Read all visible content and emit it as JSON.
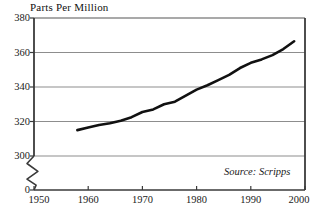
{
  "chart_data": {
    "type": "line",
    "title": "Parts Per Million",
    "xlabel": "",
    "ylabel": "",
    "source_note": "Source: Scripps",
    "grid": true,
    "legend": "none",
    "axis_break": true,
    "xlim": [
      1950,
      2000
    ],
    "ylim": [
      300,
      380
    ],
    "y_baseline_label": "0",
    "yticks": [
      380,
      360,
      340,
      320,
      300
    ],
    "ytick_labels": [
      "380",
      "360",
      "340",
      "320",
      "300",
      "0"
    ],
    "xticks": [
      1950,
      1960,
      1970,
      1980,
      1990,
      2000
    ],
    "xtick_labels": [
      "1950",
      "1960",
      "1970",
      "1980",
      "1990",
      "2000"
    ],
    "series": [
      {
        "name": "Atmospheric CO2 concentration",
        "color": "#111111",
        "x": [
          1958,
          1960,
          1962,
          1964,
          1966,
          1968,
          1970,
          1972,
          1974,
          1976,
          1978,
          1980,
          1982,
          1984,
          1986,
          1988,
          1990,
          1992,
          1994,
          1996,
          1998
        ],
        "values": [
          315.0,
          316.5,
          318.0,
          319.0,
          320.5,
          322.5,
          325.5,
          327.0,
          330.0,
          331.5,
          335.0,
          338.5,
          341.0,
          344.0,
          347.0,
          351.0,
          354.0,
          356.0,
          358.5,
          362.0,
          366.5
        ]
      }
    ]
  },
  "colors": {
    "line": "#111111",
    "axis": "#3a3a3a",
    "grid": "#8d8d8d",
    "background": "#ffffff"
  },
  "geometry": {
    "plot_left": 34,
    "plot_right": 305,
    "plot_top": 18,
    "plot_bottom": 190,
    "value_top": 380,
    "value_top_y": 18,
    "value_bottom": 300,
    "value_bottom_y": 156,
    "x_start": 1950,
    "x_start_px": 34,
    "x_end": 2000,
    "x_end_px": 305
  }
}
